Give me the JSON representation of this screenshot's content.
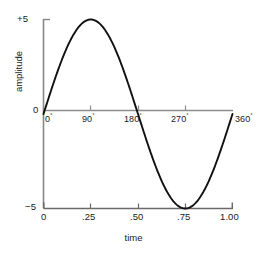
{
  "chart_data": {
    "type": "line",
    "title": "",
    "subtitle": "",
    "xlabel": "time",
    "ylabel": "amplitude",
    "xlim": [
      0,
      1.0
    ],
    "ylim": [
      -5,
      5
    ],
    "grid": false,
    "legend": null,
    "x_tick_labels": [
      "0",
      ".25",
      ".50",
      ".75",
      "1.00"
    ],
    "x_tick_values": [
      0,
      0.25,
      0.5,
      0.75,
      1.0
    ],
    "y_tick_labels": [
      "+5",
      "0",
      "-5"
    ],
    "y_tick_values": [
      5,
      0,
      -5
    ],
    "secondary_x_tick_labels": [
      "0",
      "90",
      "180",
      "270",
      "360"
    ],
    "secondary_x_tick_suffix": "°",
    "secondary_x_tick_values": [
      0,
      0.25,
      0.5,
      0.75,
      1.0
    ],
    "series": [
      {
        "name": "sine",
        "color": "#111111",
        "equation": "y = 5 * sin(2*pi*x)",
        "x": [
          0,
          0.05,
          0.1,
          0.15,
          0.2,
          0.25,
          0.3,
          0.35,
          0.4,
          0.45,
          0.5,
          0.55,
          0.6,
          0.65,
          0.7,
          0.75,
          0.8,
          0.85,
          0.9,
          0.95,
          1.0
        ],
        "values": [
          0,
          1.55,
          2.94,
          4.05,
          4.76,
          5.0,
          4.76,
          4.05,
          2.94,
          1.55,
          0,
          -1.55,
          -2.94,
          -4.05,
          -4.76,
          -5.0,
          -4.76,
          -4.05,
          -2.94,
          -1.55,
          0
        ]
      }
    ],
    "colors": {
      "curve": "#111111",
      "axis": "#888888",
      "baseline": "#888888",
      "bottom_axis": "#555555",
      "text": "#1a1a1a",
      "background": "#ffffff"
    }
  },
  "labels": {
    "y_plus5": "+5",
    "y_zero": "0",
    "y_minus5": "−5",
    "x_0": "0",
    "x_25": ".25",
    "x_50": ".50",
    "x_75": ".75",
    "x_100": "1.00",
    "deg_0": "0",
    "deg_90": "90",
    "deg_180": "180",
    "deg_270": "270",
    "deg_360": "360",
    "deg_sup": "°",
    "axis_title_y": "amplitude",
    "axis_title_x": "time"
  }
}
